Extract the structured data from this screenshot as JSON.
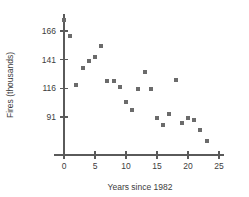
{
  "chart_data": {
    "type": "scatter",
    "title": "",
    "subtitle": "",
    "xlabel": "Years since 1982",
    "ylabel": "Fires (thousands)",
    "xlim": [
      -1.5,
      26
    ],
    "ylim": [
      60,
      182
    ],
    "xticks": [
      0,
      5,
      10,
      15,
      20,
      25
    ],
    "xtick_labels": [
      "0",
      "5",
      "10",
      "15",
      "20",
      "25"
    ],
    "yticks": [
      91,
      116,
      141,
      166
    ],
    "ytick_labels": [
      "91",
      "116",
      "141",
      "166"
    ],
    "grid": false,
    "legend": null,
    "marker": "square",
    "marker_color": "#6b6b6b",
    "marker_size": 4,
    "series": [
      {
        "name": "Fires",
        "points": [
          {
            "x": 0,
            "y": 176
          },
          {
            "x": 1,
            "y": 162
          },
          {
            "x": 2,
            "y": 119
          },
          {
            "x": 3,
            "y": 134
          },
          {
            "x": 4,
            "y": 140
          },
          {
            "x": 5,
            "y": 143
          },
          {
            "x": 6,
            "y": 153
          },
          {
            "x": 7,
            "y": 122
          },
          {
            "x": 8,
            "y": 122
          },
          {
            "x": 9,
            "y": 117
          },
          {
            "x": 10,
            "y": 104
          },
          {
            "x": 11,
            "y": 97
          },
          {
            "x": 12,
            "y": 115
          },
          {
            "x": 13,
            "y": 130
          },
          {
            "x": 14,
            "y": 115
          },
          {
            "x": 15,
            "y": 90
          },
          {
            "x": 16,
            "y": 84
          },
          {
            "x": 17,
            "y": 94
          },
          {
            "x": 18,
            "y": 123
          },
          {
            "x": 19,
            "y": 86
          },
          {
            "x": 20,
            "y": 90
          },
          {
            "x": 21,
            "y": 88
          },
          {
            "x": 22,
            "y": 80
          },
          {
            "x": 23,
            "y": 70
          }
        ]
      }
    ]
  },
  "axes": {
    "x_title": "Years since 1982",
    "y_title": "Fires (thousands)"
  }
}
